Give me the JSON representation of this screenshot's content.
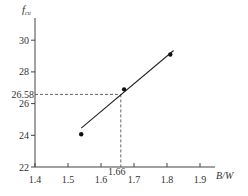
{
  "chart_data": {
    "type": "scatter",
    "title": "",
    "xlabel": "B/W",
    "ylabel": "f_cu",
    "ylabel_main": "f",
    "ylabel_sub": "cu",
    "xlim": [
      1.4,
      1.95
    ],
    "ylim": [
      22,
      31.5
    ],
    "x_ticks": [
      1.4,
      1.5,
      1.6,
      1.7,
      1.8,
      1.9
    ],
    "x_tick_labels": [
      "1.4",
      "1.5",
      "1.6",
      "1.7",
      "1.8",
      "1.9"
    ],
    "y_ticks": [
      22,
      24,
      26,
      28,
      30
    ],
    "y_tick_labels": [
      "22",
      "24",
      "26",
      "28",
      "30"
    ],
    "grid": false,
    "legend": null,
    "series": [
      {
        "name": "measured",
        "x": [
          1.54,
          1.67,
          1.81
        ],
        "y": [
          24.07,
          26.9,
          29.1
        ]
      }
    ],
    "fit_line": {
      "x": [
        1.54,
        1.82
      ],
      "y": [
        24.45,
        29.35
      ]
    },
    "annotations": [
      {
        "type": "dashed-guide",
        "x": 1.66,
        "y": 26.58,
        "x_label": "1.66",
        "y_label": "26.58"
      }
    ]
  }
}
